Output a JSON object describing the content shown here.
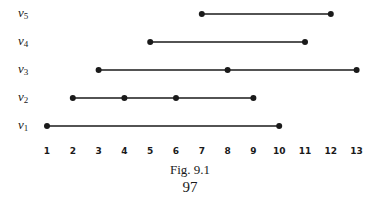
{
  "figure": {
    "caption": "Fig. 9.1",
    "page_number": "97",
    "axis_ticks": [
      "1",
      "2",
      "3",
      "4",
      "5",
      "6",
      "7",
      "8",
      "9",
      "10",
      "11",
      "12",
      "13"
    ],
    "rows": [
      {
        "label": "v",
        "sub": "5",
        "start": 7,
        "end": 12,
        "points": [
          7,
          12
        ]
      },
      {
        "label": "v",
        "sub": "4",
        "start": 5,
        "end": 11,
        "points": [
          5,
          11
        ]
      },
      {
        "label": "v",
        "sub": "3",
        "start": 3,
        "end": 13,
        "points": [
          3,
          8,
          13
        ]
      },
      {
        "label": "v",
        "sub": "2",
        "start": 2,
        "end": 9,
        "points": [
          2,
          4,
          6,
          9
        ]
      },
      {
        "label": "v",
        "sub": "1",
        "start": 1,
        "end": 10,
        "points": [
          1,
          10
        ]
      }
    ],
    "colors": {
      "ink": "#1a1a1a",
      "background": "#ffffff"
    }
  }
}
